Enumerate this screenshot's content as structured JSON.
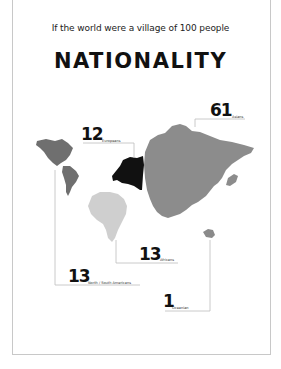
{
  "header": {
    "subtitle": "If the world were a village of 100 people",
    "title": "NATIONALITY"
  },
  "colors": {
    "asia": "#8c8c8c",
    "europe": "#111111",
    "americas": "#6f6f6f",
    "africa": "#cfcfcf",
    "oceania": "#8a8a8a",
    "leader_lines": "#bdbdbd"
  },
  "regions": [
    {
      "key": "asia",
      "value": "61",
      "label": "Asians"
    },
    {
      "key": "europe",
      "value": "12",
      "label": "Europeans"
    },
    {
      "key": "africa",
      "value": "13",
      "label": "Africans"
    },
    {
      "key": "americas",
      "value": "13",
      "label": "North / South Americans"
    },
    {
      "key": "oceania",
      "value": "1",
      "label": "Oceanian"
    }
  ]
}
